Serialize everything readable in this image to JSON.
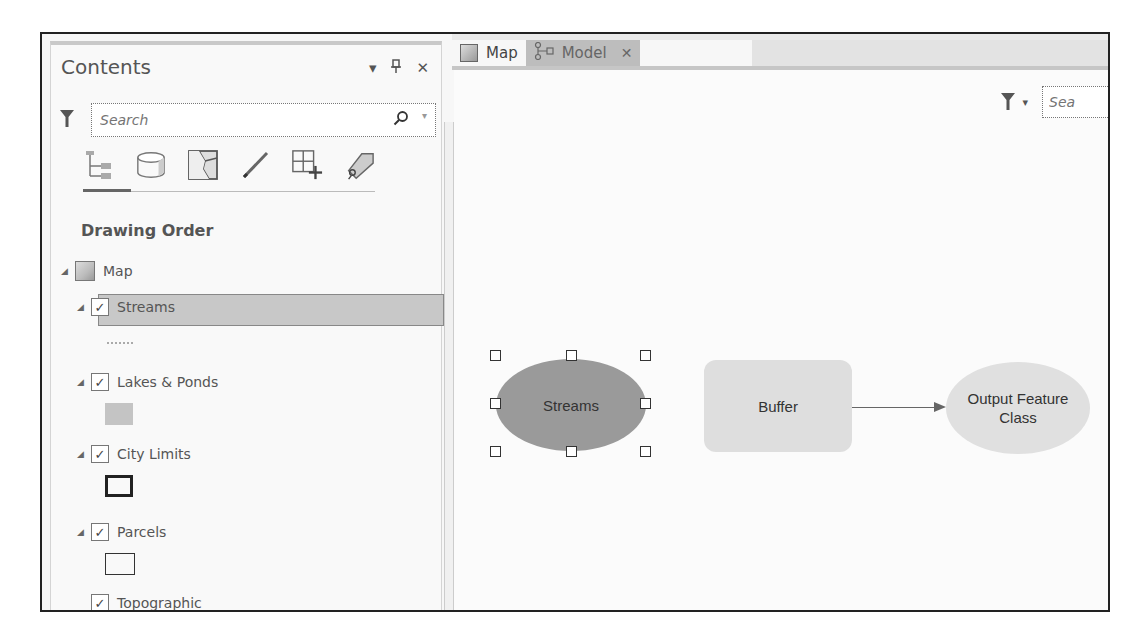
{
  "contents_pane": {
    "title": "Contents",
    "controls": {
      "options": "▾",
      "pin": "⊥",
      "close": "✕"
    },
    "search": {
      "placeholder": "Search",
      "value": ""
    },
    "view_icons": [
      {
        "name": "list-by-drawing-order-icon",
        "active": true
      },
      {
        "name": "list-by-data-source-icon"
      },
      {
        "name": "list-by-selection-icon"
      },
      {
        "name": "list-by-editing-icon"
      },
      {
        "name": "list-by-snapping-icon"
      },
      {
        "name": "list-by-labeling-icon"
      }
    ],
    "section_title": "Drawing Order",
    "tree": {
      "map": {
        "label": "Map",
        "expanded": true
      },
      "layers": [
        {
          "label": "Streams",
          "checked": true,
          "expanded": true,
          "selected": true,
          "symbol": "line"
        },
        {
          "label": "Lakes & Ponds",
          "checked": true,
          "expanded": true,
          "symbol": "fill-gray"
        },
        {
          "label": "City Limits",
          "checked": true,
          "expanded": true,
          "symbol": "outline-thick"
        },
        {
          "label": "Parcels",
          "checked": true,
          "expanded": true,
          "symbol": "outline-thin"
        },
        {
          "label": "Topographic",
          "checked": true,
          "expanded": false,
          "symbol": null
        }
      ],
      "check_glyph": "✓",
      "expand_glyph": "◢"
    }
  },
  "tabs": [
    {
      "label": "Map",
      "icon": "map-icon",
      "active": false
    },
    {
      "label": "Model",
      "icon": "model-icon",
      "active": true,
      "close": "✕"
    }
  ],
  "model_canvas": {
    "search": {
      "placeholder": "Sea",
      "value": ""
    },
    "nodes": [
      {
        "id": "streams",
        "label": "Streams",
        "shape": "ellipse",
        "fill": "#9a9a9a",
        "selected": true
      },
      {
        "id": "buffer",
        "label": "Buffer",
        "shape": "rounded-rect",
        "fill": "#dedede"
      },
      {
        "id": "output",
        "label": "Output Feature Class",
        "line1": "Output Feature",
        "line2": "Class",
        "shape": "ellipse",
        "fill": "#e0e0e0"
      }
    ],
    "connections": [
      {
        "from": "buffer",
        "to": "output"
      }
    ]
  }
}
